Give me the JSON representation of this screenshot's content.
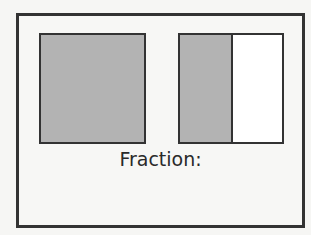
{
  "figure": {
    "label": "Fraction:",
    "whole_box": {
      "state": "fully-shaded",
      "shaded_color": "#b3b3b3"
    },
    "split_box": {
      "parts": [
        {
          "state": "shaded",
          "color": "#b3b3b3"
        },
        {
          "state": "unshaded",
          "color": "#ffffff"
        }
      ]
    },
    "border_color": "#333333"
  }
}
